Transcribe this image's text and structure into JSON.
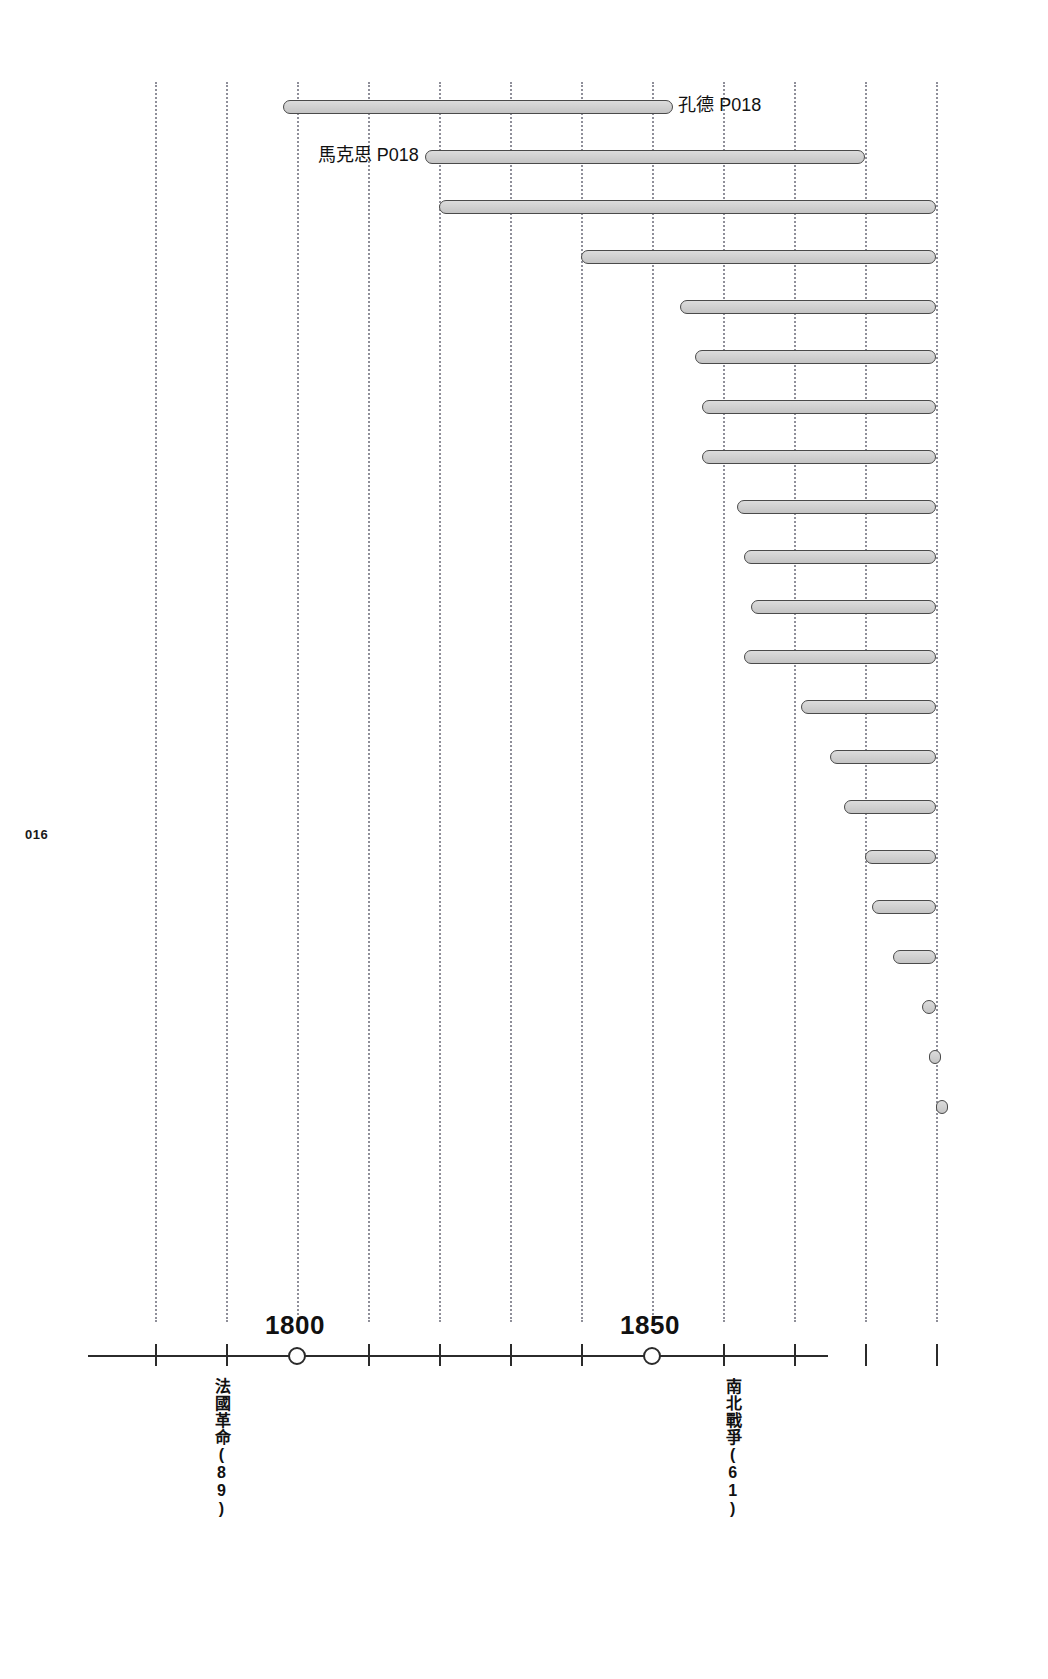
{
  "page": {
    "folio": "016",
    "background_color": "#ffffff",
    "width": 1048,
    "height": 1679
  },
  "chart_data": {
    "type": "bar",
    "orientation": "horizontal",
    "title": "",
    "subtitle": "",
    "xlabel": "",
    "ylabel": "",
    "xlim": [
      1780,
      1890
    ],
    "x_tick_step": 10,
    "grid": true,
    "grid_style": "dotted-vertical",
    "grid_color": "#8a8a94",
    "axis_tick_labels": [
      "1800",
      "1850"
    ],
    "axis_marked_years": [
      1800,
      1850
    ],
    "bar_fill_color": "#d2d2d2",
    "bar_stroke_color": "#4a4a4a",
    "legend": "none",
    "categories": [
      "孔德 P018",
      "馬克思 P018",
      "bar-3",
      "bar-4",
      "bar-5",
      "bar-6",
      "bar-7",
      "bar-8",
      "bar-9",
      "bar-10",
      "bar-11",
      "bar-12",
      "bar-13",
      "bar-14",
      "bar-15",
      "bar-16",
      "bar-17",
      "bar-18",
      "bar-19",
      "bar-20",
      "bar-21",
      "bar-22"
    ],
    "bars": [
      {
        "label": "孔德 P018",
        "start_year": 1798,
        "end_year": 1853,
        "label_side": "right"
      },
      {
        "label": "馬克思 P018",
        "start_year": 1818,
        "end_year": 1880,
        "label_side": "left"
      },
      {
        "label": "",
        "start_year": 1820,
        "end_year": 1890,
        "label_side": "none"
      },
      {
        "label": "",
        "start_year": 1840,
        "end_year": 1890,
        "label_side": "none"
      },
      {
        "label": "",
        "start_year": 1854,
        "end_year": 1890,
        "label_side": "none"
      },
      {
        "label": "",
        "start_year": 1856,
        "end_year": 1890,
        "label_side": "none"
      },
      {
        "label": "",
        "start_year": 1857,
        "end_year": 1890,
        "label_side": "none"
      },
      {
        "label": "",
        "start_year": 1857,
        "end_year": 1890,
        "label_side": "none"
      },
      {
        "label": "",
        "start_year": 1862,
        "end_year": 1890,
        "label_side": "none"
      },
      {
        "label": "",
        "start_year": 1863,
        "end_year": 1890,
        "label_side": "none"
      },
      {
        "label": "",
        "start_year": 1864,
        "end_year": 1890,
        "label_side": "none"
      },
      {
        "label": "",
        "start_year": 1863,
        "end_year": 1890,
        "label_side": "none"
      },
      {
        "label": "",
        "start_year": 1871,
        "end_year": 1890,
        "label_side": "none"
      },
      {
        "label": "",
        "start_year": 1875,
        "end_year": 1890,
        "label_side": "none"
      },
      {
        "label": "",
        "start_year": 1877,
        "end_year": 1890,
        "label_side": "none"
      },
      {
        "label": "",
        "start_year": 1880,
        "end_year": 1890,
        "label_side": "none"
      },
      {
        "label": "",
        "start_year": 1881,
        "end_year": 1890,
        "label_side": "none"
      },
      {
        "label": "",
        "start_year": 1884,
        "end_year": 1890,
        "label_side": "none"
      },
      {
        "label": "",
        "start_year": 1888,
        "end_year": 1890,
        "label_side": "none"
      },
      {
        "label": "",
        "start_year": 1889,
        "end_year": 1890,
        "label_side": "none"
      },
      {
        "label": "",
        "start_year": 1890,
        "end_year": 1890,
        "label_side": "none"
      }
    ],
    "annotations": [
      {
        "name": "french-revolution",
        "text": "法國革命(89)",
        "year": 1789
      },
      {
        "name": "american-civil-war",
        "text": "南北戰爭(61)",
        "year": 1861
      }
    ]
  },
  "axis": {
    "tick_labels": [
      {
        "text": "1800",
        "year": 1800
      },
      {
        "text": "1850",
        "year": 1850
      }
    ],
    "events": [
      {
        "text": "法國革命(89)",
        "year": 1789
      },
      {
        "text": "南北戰爭(61)",
        "year": 1861
      }
    ]
  },
  "bar_labels": {
    "comte": "孔德 P018",
    "marx": "馬克思 P018"
  }
}
